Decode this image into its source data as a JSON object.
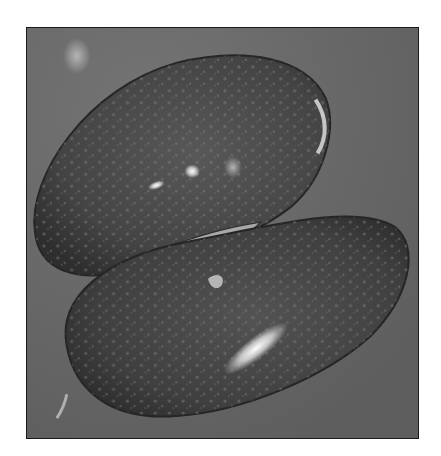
{
  "figure": {
    "colors": {
      "background": "#6a6a6a",
      "seed_dark": "#3c3c3c",
      "seed_mid": "#4f4f4f",
      "highlight": "#e8e8e8",
      "border": "#1a1a1a"
    }
  },
  "caption": {
    "text": ""
  }
}
